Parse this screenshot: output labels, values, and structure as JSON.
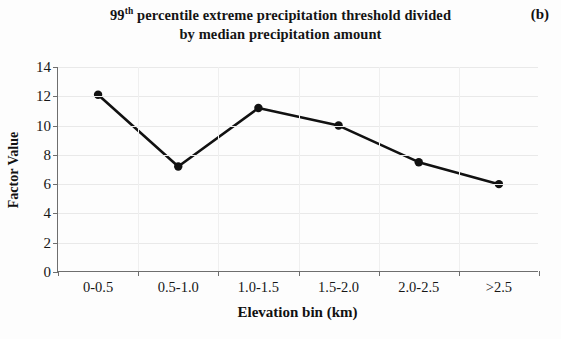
{
  "panel": {
    "label": "(b)"
  },
  "title": {
    "line1_prefix": "99",
    "line1_sup": "th",
    "line1_rest": " percentile extreme precipitation threshold divided",
    "line2": "by median precipitation amount",
    "full": "99th percentile extreme precipitation threshold divided by median precipitation amount"
  },
  "axes": {
    "xlabel": "Elevation bin (km)",
    "ylabel": "Factor Value",
    "ytick_labels": [
      "0",
      "2",
      "4",
      "6",
      "8",
      "10",
      "12",
      "14"
    ],
    "xtick_labels": [
      "0-0.5",
      "0.5-1.0",
      "1.0-1.5",
      "1.5-2.0",
      "2.0-2.5",
      ">2.5"
    ]
  },
  "style": {
    "line_color": "#111111",
    "marker_color": "#111111",
    "axis_color": "#6e6e6e",
    "grid_color": "#e9e9e9",
    "background": "#fdfdfd"
  },
  "chart_data": {
    "type": "line",
    "title": "99th percentile extreme precipitation threshold divided by median precipitation amount",
    "subtitle": "",
    "panel_label": "(b)",
    "xlabel": "Elevation bin (km)",
    "ylabel": "Factor Value",
    "categories": [
      "0-0.5",
      "0.5-1.0",
      "1.0-1.5",
      "1.5-2.0",
      "2.0-2.5",
      ">2.5"
    ],
    "values": [
      12.1,
      7.2,
      11.2,
      10.0,
      7.5,
      6.0
    ],
    "series": [
      {
        "name": "Factor Value",
        "values": [
          12.1,
          7.2,
          11.2,
          10.0,
          7.5,
          6.0
        ]
      }
    ],
    "ylim": [
      0,
      14
    ],
    "yticks": [
      0,
      2,
      4,
      6,
      8,
      10,
      12,
      14
    ],
    "grid": true,
    "legend": false,
    "markers": "filled-circle"
  }
}
